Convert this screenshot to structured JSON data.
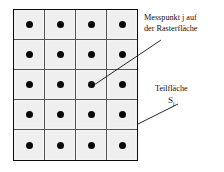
{
  "figure": {
    "grid": {
      "columns": 4,
      "rows": 5,
      "cell_marker": "measurement-point-dot",
      "cell_fill_color": "#f2f2f2",
      "cell_border_color": "#555555",
      "outer_border_color": "#0b0b0b",
      "dot_color": "#080808",
      "cells": [
        [
          {
            "marker": "●"
          },
          {
            "marker": "●"
          },
          {
            "marker": "●"
          },
          {
            "marker": "●"
          }
        ],
        [
          {
            "marker": "●"
          },
          {
            "marker": "●"
          },
          {
            "marker": "●"
          },
          {
            "marker": "●"
          }
        ],
        [
          {
            "marker": "●"
          },
          {
            "marker": "●"
          },
          {
            "marker": "●"
          },
          {
            "marker": "●"
          }
        ],
        [
          {
            "marker": "●"
          },
          {
            "marker": "●"
          },
          {
            "marker": "●"
          },
          {
            "marker": "●"
          }
        ],
        [
          {
            "marker": "●"
          },
          {
            "marker": "●"
          },
          {
            "marker": "●"
          },
          {
            "marker": "●"
          }
        ]
      ]
    },
    "annotations": {
      "measurement_point": {
        "line1": "Messpunkt j auf",
        "line2": "der Rasterfläche",
        "leader": "line-from-text-to-grid-dot-row3-col3"
      },
      "subarea": {
        "label": "Teilfläche",
        "symbol_base": "S",
        "symbol_subscript": "i",
        "leader": "line-from-symbol-to-grid-right-edge"
      }
    },
    "leader_line_color": "#111111"
  }
}
